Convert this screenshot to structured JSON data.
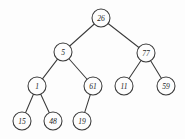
{
  "figure": {
    "background_color": "#fdfdfd",
    "stroke_color": "#3a3a3a",
    "text_color": "#262626",
    "node_radius": 9,
    "width": 185,
    "height": 139
  },
  "chart_data": {
    "type": "diagram",
    "diagram_kind": "binary-search-tree",
    "title": "",
    "nodes": [
      {
        "id": "n26",
        "label": "26",
        "x": 101,
        "y": 18,
        "depth": 0,
        "parent": null
      },
      {
        "id": "n5",
        "label": "5",
        "x": 63,
        "y": 52,
        "depth": 1,
        "parent": "n26",
        "side": "left"
      },
      {
        "id": "n77",
        "label": "77",
        "x": 146,
        "y": 53,
        "depth": 1,
        "parent": "n26",
        "side": "right"
      },
      {
        "id": "n1",
        "label": "1",
        "x": 37,
        "y": 86,
        "depth": 2,
        "parent": "n5",
        "side": "left"
      },
      {
        "id": "n61",
        "label": "61",
        "x": 93,
        "y": 86,
        "depth": 2,
        "parent": "n5",
        "side": "right"
      },
      {
        "id": "n11",
        "label": "11",
        "x": 124,
        "y": 86,
        "depth": 2,
        "parent": "n77",
        "side": "left"
      },
      {
        "id": "n59",
        "label": "59",
        "x": 166,
        "y": 86,
        "depth": 2,
        "parent": "n77",
        "side": "right"
      },
      {
        "id": "n15",
        "label": "15",
        "x": 22,
        "y": 121,
        "depth": 3,
        "parent": "n1",
        "side": "left"
      },
      {
        "id": "n48",
        "label": "48",
        "x": 53,
        "y": 121,
        "depth": 3,
        "parent": "n1",
        "side": "right"
      },
      {
        "id": "n19",
        "label": "19",
        "x": 82,
        "y": 121,
        "depth": 3,
        "parent": "n61",
        "side": "left"
      }
    ],
    "edges": [
      {
        "from": "n26",
        "to": "n5"
      },
      {
        "from": "n26",
        "to": "n77"
      },
      {
        "from": "n5",
        "to": "n1"
      },
      {
        "from": "n5",
        "to": "n61"
      },
      {
        "from": "n77",
        "to": "n11"
      },
      {
        "from": "n77",
        "to": "n59"
      },
      {
        "from": "n1",
        "to": "n15"
      },
      {
        "from": "n1",
        "to": "n48"
      },
      {
        "from": "n61",
        "to": "n19"
      }
    ],
    "values": [
      26,
      5,
      77,
      1,
      61,
      11,
      59,
      15,
      48,
      19
    ]
  }
}
